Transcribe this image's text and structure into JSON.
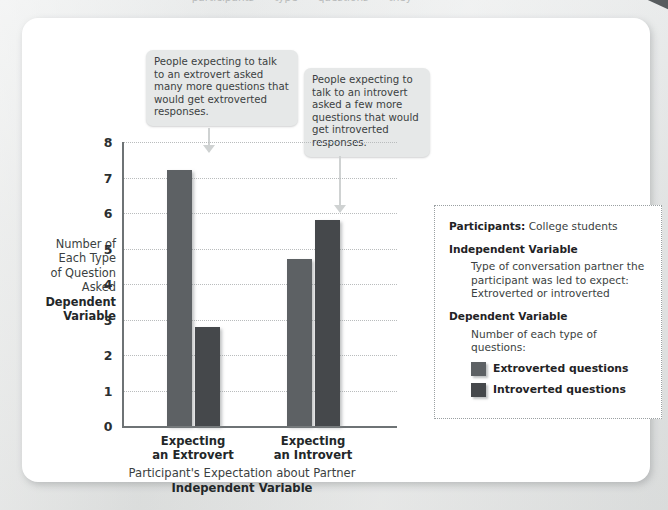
{
  "page": {
    "top_cut_text": "···· participants ···· type ···· questions ···· they ····",
    "background_color": "#d9dbdb",
    "card_color": "#ffffff"
  },
  "callouts": [
    {
      "id": "extrovert",
      "text": "People expecting to talk to an extrovert asked many more questions that would get extroverted responses."
    },
    {
      "id": "introvert",
      "text": "People expecting to talk to an introvert asked a few more questions that would get introverted responses."
    }
  ],
  "axes": {
    "ylabel_lines": [
      "Number of",
      "Each Type",
      "of Question",
      "Asked"
    ],
    "ylabel_strong": [
      "Dependent",
      "Variable"
    ],
    "xlabel_line": "Participant's Expectation about Partner",
    "xlabel_strong": "Independent Variable",
    "yticks": [
      "8",
      "7",
      "6",
      "5",
      "4",
      "3",
      "2",
      "1",
      "0"
    ]
  },
  "infobox": {
    "participants_label": "Participants:",
    "participants_value": "College students",
    "iv_heading": "Independent Variable",
    "iv_text": "Type of conversation partner the participant was led to expect: Extroverted or introverted",
    "dv_heading": "Dependent Variable",
    "dv_text": "Number of each type of questions:",
    "legend": [
      {
        "label": "Extroverted questions",
        "color": "#5d6164",
        "swatch": "light"
      },
      {
        "label": "Introverted questions",
        "color": "#45484b",
        "swatch": "dark"
      }
    ]
  },
  "chart_data": {
    "type": "bar",
    "title": "",
    "xlabel": "Participant's Expectation about Partner / Independent Variable",
    "ylabel": "Number of Each Type of Question Asked / Dependent Variable",
    "categories": [
      "Expecting an Extrovert",
      "Expecting an Introvert"
    ],
    "series": [
      {
        "name": "Extroverted questions",
        "color": "#5d6164",
        "values": [
          7.2,
          4.7
        ]
      },
      {
        "name": "Introverted questions",
        "color": "#45484b",
        "values": [
          2.8,
          5.8
        ]
      }
    ],
    "ylim": [
      0,
      8
    ],
    "ytick_step": 1,
    "grid": "horizontal-dotted",
    "legend_position": "right-infobox",
    "annotations": [
      {
        "target": "Extroverted questions @ Expecting an Extrovert",
        "text": "People expecting to talk to an extrovert asked many more questions that would get extroverted responses."
      },
      {
        "target": "Introverted questions @ Expecting an Introvert",
        "text": "People expecting to talk to an introvert asked a few more questions that would get introverted responses."
      }
    ]
  }
}
